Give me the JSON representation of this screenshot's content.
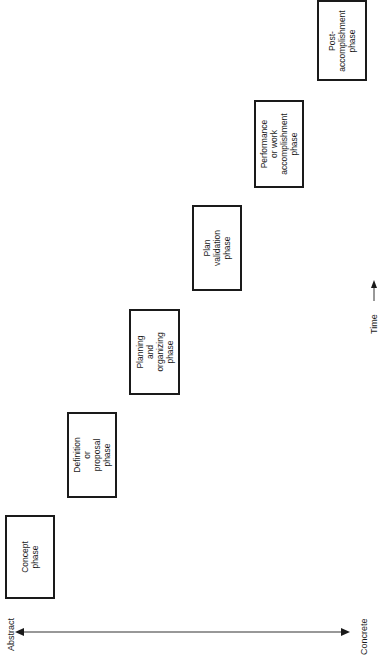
{
  "diagram": {
    "type": "staircase-phase-diagram",
    "orientation": "rotated-90-ccw",
    "axis": {
      "left_label": "Abstract",
      "right_label": "Concrete",
      "time_label": "Time"
    },
    "phases": [
      {
        "label": "Concept\nphase",
        "box": {
          "x": 5,
          "y": 515,
          "w": 50,
          "h": 84
        }
      },
      {
        "label": "Definition\nor proposal\nphase",
        "box": {
          "x": 67,
          "y": 412,
          "w": 50,
          "h": 86
        }
      },
      {
        "label": "Planning and\norganizing\nphase",
        "box": {
          "x": 129,
          "y": 309,
          "w": 51,
          "h": 86
        }
      },
      {
        "label": "Plan\nvalidation\nphase",
        "box": {
          "x": 192,
          "y": 205,
          "w": 50,
          "h": 86
        }
      },
      {
        "label": "Performance\nor work\naccomplishment\nphase",
        "box": {
          "x": 254,
          "y": 100,
          "w": 50,
          "h": 88
        }
      },
      {
        "label": "Post-\naccomplishment\nphase",
        "box": {
          "x": 317,
          "y": 0,
          "w": 50,
          "h": 81
        }
      }
    ],
    "colors": {
      "stroke": "#1a1a1a",
      "background": "#ffffff"
    }
  }
}
